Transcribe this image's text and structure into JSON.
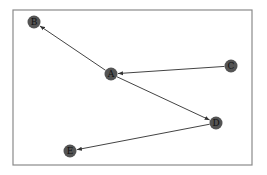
{
  "diagram": {
    "type": "directed-graph",
    "frame": {
      "x": 13,
      "y": 10,
      "width": 239,
      "height": 155,
      "stroke": "#8a8a8a"
    },
    "node_style": {
      "radius": 6.5,
      "fill": "#545454",
      "label_color": "#111111"
    },
    "edge_style": {
      "stroke": "#444444"
    },
    "nodes": [
      {
        "id": "A",
        "label": "A",
        "x": 111,
        "y": 74
      },
      {
        "id": "B",
        "label": "B",
        "x": 34,
        "y": 22
      },
      {
        "id": "C",
        "label": "C",
        "x": 231,
        "y": 66
      },
      {
        "id": "D",
        "label": "D",
        "x": 216,
        "y": 123
      },
      {
        "id": "E",
        "label": "E",
        "x": 70,
        "y": 151
      }
    ],
    "edges": [
      {
        "from": "A",
        "to": "B"
      },
      {
        "from": "C",
        "to": "A"
      },
      {
        "from": "A",
        "to": "D"
      },
      {
        "from": "D",
        "to": "E"
      }
    ]
  }
}
